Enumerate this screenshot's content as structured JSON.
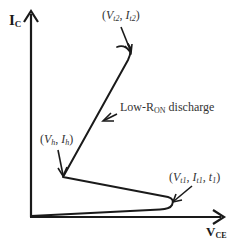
{
  "diagram": {
    "title": "",
    "y_axis": {
      "label_main": "I",
      "label_sub": "C"
    },
    "x_axis": {
      "label_main": "V",
      "label_sub": "CE"
    },
    "points": {
      "trigger2": {
        "open": "(",
        "v": "V",
        "v_sub": "t2",
        "sep": ", ",
        "i": "I",
        "i_sub": "t2",
        "close": ")"
      },
      "holding": {
        "open": "(",
        "v": "V",
        "v_sub": "h",
        "sep": ", ",
        "i": "I",
        "i_sub": "h",
        "close": ")"
      },
      "trigger1": {
        "open": "(",
        "v": "V",
        "v_sub": "t1",
        "sep": ", ",
        "i": "I",
        "i_sub": "t1",
        "sep2": ", ",
        "t": "t",
        "t_sub": "1",
        "close": ")"
      }
    },
    "annotation": {
      "prefix": "Low-R",
      "sub": "ON",
      "suffix": " discharge"
    },
    "colors": {
      "line": "#1a1a1a",
      "text": "#333333",
      "background": "#ffffff"
    }
  }
}
